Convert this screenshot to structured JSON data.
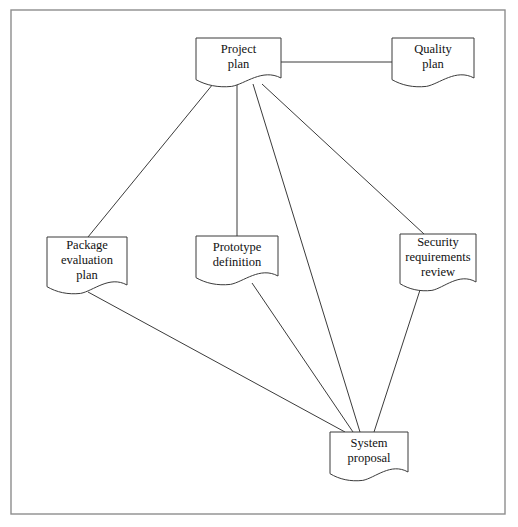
{
  "diagram": {
    "frame": {
      "x": 11,
      "y": 10,
      "width": 494,
      "height": 504,
      "stroke": "#8d8d8d"
    },
    "style": {
      "node_fill": "#ffffff",
      "node_stroke": "#3b3b3b",
      "edge_stroke": "#3b3b3b",
      "text_color": "#111111",
      "shape": "document"
    },
    "nodes": [
      {
        "id": "project-plan",
        "lines": [
          "Project",
          "plan"
        ],
        "text": "Project plan",
        "x": 196,
        "y": 38,
        "width": 85,
        "height": 40
      },
      {
        "id": "quality-plan",
        "lines": [
          "Quality",
          "plan"
        ],
        "text": "Quality plan",
        "x": 392,
        "y": 38,
        "width": 82,
        "height": 40
      },
      {
        "id": "package-evaluation-plan",
        "lines": [
          "Package",
          "evaluation",
          "plan"
        ],
        "text": "Package evaluation plan",
        "x": 47,
        "y": 237,
        "width": 80,
        "height": 48
      },
      {
        "id": "prototype-definition",
        "lines": [
          "Prototype",
          "definition"
        ],
        "text": "Prototype definition",
        "x": 196,
        "y": 236,
        "width": 82,
        "height": 40
      },
      {
        "id": "security-requirements-review",
        "lines": [
          "Security",
          "requirements",
          "review"
        ],
        "text": "Security requirements review",
        "x": 400,
        "y": 234,
        "width": 76,
        "height": 48
      },
      {
        "id": "system-proposal",
        "lines": [
          "System",
          "proposal"
        ],
        "text": "System proposal",
        "x": 330,
        "y": 432,
        "width": 78,
        "height": 40
      }
    ],
    "edges": [
      {
        "id": "project-plan--quality-plan",
        "from": "project-plan",
        "to": "quality-plan",
        "x1": 281,
        "y1": 62,
        "x2": 392,
        "y2": 62
      },
      {
        "id": "project-plan--package-evaluation-plan",
        "from": "project-plan",
        "to": "package-evaluation-plan",
        "x1": 213,
        "y1": 84,
        "x2": 88,
        "y2": 237
      },
      {
        "id": "project-plan--prototype-definition",
        "from": "project-plan",
        "to": "prototype-definition",
        "x1": 237,
        "y1": 84,
        "x2": 237,
        "y2": 236
      },
      {
        "id": "project-plan--security-requirements-review",
        "from": "project-plan",
        "to": "security-requirements-review",
        "x1": 262,
        "y1": 84,
        "x2": 424,
        "y2": 234
      },
      {
        "id": "project-plan--system-proposal",
        "from": "project-plan",
        "to": "system-proposal",
        "x1": 253,
        "y1": 84,
        "x2": 360,
        "y2": 432
      },
      {
        "id": "package-evaluation-plan--system-proposal",
        "from": "package-evaluation-plan",
        "to": "system-proposal",
        "x1": 88,
        "y1": 292,
        "x2": 345,
        "y2": 432
      },
      {
        "id": "prototype-definition--system-proposal",
        "from": "prototype-definition",
        "to": "system-proposal",
        "x1": 252,
        "y1": 283,
        "x2": 353,
        "y2": 432
      },
      {
        "id": "security-requirements-review--system-proposal",
        "from": "security-requirements-review",
        "to": "system-proposal",
        "x1": 420,
        "y1": 290,
        "x2": 374,
        "y2": 432
      }
    ]
  }
}
